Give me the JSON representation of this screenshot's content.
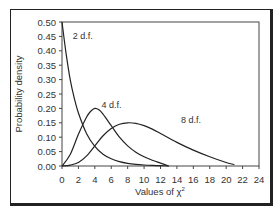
{
  "chart_data": {
    "type": "line",
    "title": "",
    "xlabel": "Values of χ²",
    "ylabel": "Probability density",
    "xlim": [
      0,
      24
    ],
    "ylim": [
      0,
      0.5
    ],
    "grid": false,
    "legend_position": "inline labels",
    "x_ticks": [
      0,
      2,
      4,
      6,
      8,
      10,
      12,
      14,
      16,
      18,
      20,
      22,
      24
    ],
    "y_ticks": [
      "0.00",
      "0.05",
      "0.10",
      "0.15",
      "0.20",
      "0.25",
      "0.30",
      "0.35",
      "0.40",
      "0.45",
      "0.50"
    ],
    "series": [
      {
        "name": "2 d.f.",
        "x": [
          0,
          0.5,
          1,
          1.5,
          2,
          3,
          4,
          5,
          6,
          7,
          8,
          9,
          10,
          11,
          12,
          13
        ],
        "values": [
          0.5,
          0.39,
          0.3,
          0.235,
          0.184,
          0.112,
          0.068,
          0.041,
          0.025,
          0.015,
          0.009,
          0.0055,
          0.0034,
          0.002,
          0.0012,
          0.0
        ]
      },
      {
        "name": "4 d.f.",
        "x": [
          0,
          1,
          2,
          3,
          3.5,
          4,
          4.5,
          5,
          6,
          7,
          8,
          9,
          10,
          11,
          12,
          13
        ],
        "values": [
          0.0,
          0.04,
          0.11,
          0.17,
          0.19,
          0.2,
          0.195,
          0.18,
          0.14,
          0.1,
          0.07,
          0.048,
          0.032,
          0.02,
          0.01,
          0.0
        ]
      },
      {
        "name": "8 d.f.",
        "x": [
          0,
          1,
          2,
          3,
          4,
          5,
          6,
          7,
          8,
          9,
          10,
          11,
          12,
          14,
          16,
          18,
          20,
          21
        ],
        "values": [
          0.0,
          0.003,
          0.012,
          0.035,
          0.07,
          0.105,
          0.13,
          0.145,
          0.15,
          0.148,
          0.14,
          0.128,
          0.113,
          0.082,
          0.055,
          0.032,
          0.012,
          0.005
        ]
      }
    ],
    "annotations": [
      {
        "text": "2 d.f.",
        "x": 1.3,
        "y": 0.44
      },
      {
        "text": "4 d.f.",
        "x": 4.8,
        "y": 0.2
      },
      {
        "text": "8 d.f.",
        "x": 14.5,
        "y": 0.15
      }
    ]
  },
  "labels": {
    "xlabel": "Values of χ",
    "xlabel_sup": "2",
    "ylabel": "Probability density",
    "curve_2df": "2 d.f.",
    "curve_4df": "4 d.f.",
    "curve_8df": "8 d.f."
  }
}
